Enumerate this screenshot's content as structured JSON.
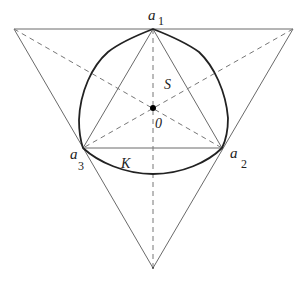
{
  "figure": {
    "colors": {
      "background": "#ffffff",
      "thin_line": "#666666",
      "curve": "#222222",
      "dashed": "#777777",
      "point": "#000000"
    },
    "labels": {
      "a1": {
        "base": "a",
        "sub": "1"
      },
      "a2": {
        "base": "a",
        "sub": "2"
      },
      "a3": {
        "base": "a",
        "sub": "3"
      },
      "S": "S",
      "O": "0",
      "K": "K"
    },
    "points": {
      "outer_top_left": [
        14,
        29
      ],
      "outer_top_right": [
        293,
        29
      ],
      "outer_bottom": [
        153,
        268
      ],
      "a1": [
        153,
        29
      ],
      "a2": [
        222,
        148
      ],
      "a3": [
        83,
        148
      ],
      "O": [
        153,
        108
      ]
    }
  }
}
